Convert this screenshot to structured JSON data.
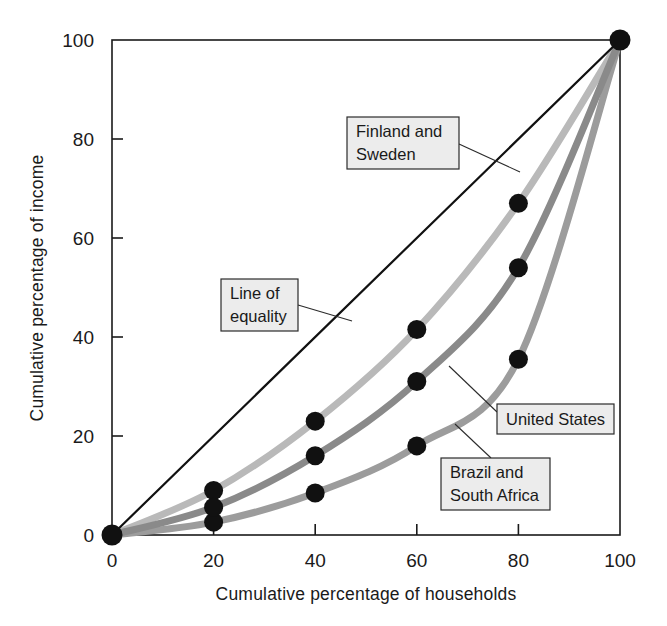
{
  "chart_data": {
    "type": "line",
    "title": "",
    "xlabel": "Cumulative percentage of households",
    "ylabel": "Cumulative percentage of income",
    "xlim": [
      0,
      100
    ],
    "ylim": [
      0,
      100
    ],
    "xticks": [
      0,
      20,
      40,
      60,
      80,
      100
    ],
    "yticks": [
      0,
      20,
      40,
      60,
      80,
      100
    ],
    "xtick_labels": [
      "0",
      "20",
      "40",
      "60",
      "80",
      "100"
    ],
    "ytick_labels": [
      "0",
      "20",
      "40",
      "60",
      "80",
      "100"
    ],
    "grid": false,
    "legend_position": "annotations-inline",
    "x": [
      0,
      20,
      40,
      60,
      80,
      100
    ],
    "series": [
      {
        "name": "Line of equality",
        "color": "#111111",
        "width": 2.2,
        "values": [
          0,
          20,
          40,
          60,
          80,
          100
        ],
        "markers": false
      },
      {
        "name": "Finland and Sweden",
        "color": "#b9b9b9",
        "width": 7,
        "values": [
          0,
          9,
          23,
          41.5,
          67,
          100
        ],
        "markers": true
      },
      {
        "name": "United States",
        "color": "#8a8a8a",
        "width": 7,
        "values": [
          0,
          5.6,
          16,
          31,
          54,
          100
        ],
        "markers": true
      },
      {
        "name": "Brazil and South Africa",
        "color": "#9c9c9c",
        "width": 7,
        "values": [
          0,
          2.6,
          8.5,
          18,
          35.5,
          100
        ],
        "markers": true
      }
    ],
    "annotations": [
      {
        "id": "finland-sweden",
        "lines": [
          "Finland and",
          "Sweden"
        ],
        "box": {
          "x": 347,
          "y": 117,
          "w": 112,
          "h": 52
        },
        "leader": [
          [
            459,
            144
          ],
          [
            520,
            172
          ]
        ]
      },
      {
        "id": "line-of-equality",
        "lines": [
          "Line of",
          "equality"
        ],
        "box": {
          "x": 221,
          "y": 279,
          "w": 77,
          "h": 52
        },
        "leader": [
          [
            298,
            305
          ],
          [
            352,
            321
          ]
        ]
      },
      {
        "id": "united-states",
        "lines": [
          "United States"
        ],
        "box": {
          "x": 497,
          "y": 404,
          "w": 117,
          "h": 30
        },
        "leader": [
          [
            497,
            412
          ],
          [
            449,
            366
          ]
        ]
      },
      {
        "id": "brazil-south-africa",
        "lines": [
          "Brazil and",
          "South Africa"
        ],
        "box": {
          "x": 441,
          "y": 458,
          "w": 109,
          "h": 52
        },
        "leader": [
          [
            491,
            458
          ],
          [
            455,
            424
          ]
        ]
      }
    ]
  },
  "axes": {
    "y_title": "Cumulative percentage of income",
    "x_title": "Cumulative percentage of households"
  }
}
